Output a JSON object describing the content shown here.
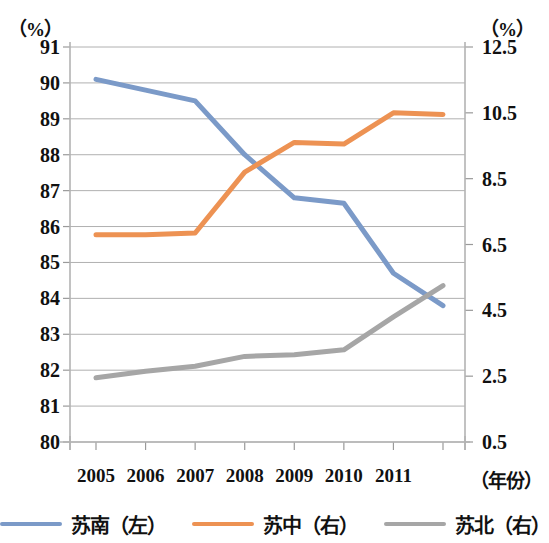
{
  "axes": {
    "left_unit": "（%）",
    "right_unit": "（%）",
    "x_caption": "（年份）",
    "left_ticks": [
      "91",
      "90",
      "89",
      "88",
      "87",
      "86",
      "85",
      "84",
      "83",
      "82",
      "81",
      "80"
    ],
    "right_ticks": [
      "12.5",
      "10.5",
      "8.5",
      "6.5",
      "4.5",
      "2.5",
      "0.5"
    ],
    "x_ticks": [
      "2005",
      "2006",
      "2007",
      "2008",
      "2009",
      "2010",
      "2011"
    ]
  },
  "legend": {
    "items": [
      {
        "label": "苏南（左）",
        "color": "#7b9ac8"
      },
      {
        "label": "苏中（右）",
        "color": "#ed9253"
      },
      {
        "label": "苏北（右）",
        "color": "#a6a6a6"
      }
    ]
  },
  "chart_data": {
    "type": "line",
    "title": "",
    "xlabel": "（年份）",
    "ylabel": "（%）",
    "grid": true,
    "legend_position": "bottom",
    "x": [
      2005,
      2006,
      2007,
      2008,
      2009,
      2010,
      2011,
      2012
    ],
    "x_tick_labels": [
      "2005",
      "2006",
      "2007",
      "2008",
      "2009",
      "2010",
      "2011",
      ""
    ],
    "y_left_label": "（%）",
    "y_right_label": "（%）",
    "ylim_left": [
      80,
      91
    ],
    "ylim_right": [
      0.5,
      12.5
    ],
    "yticks_left": [
      80,
      81,
      82,
      83,
      84,
      85,
      86,
      87,
      88,
      89,
      90,
      91
    ],
    "yticks_right": [
      0.5,
      2.5,
      4.5,
      6.5,
      8.5,
      10.5,
      12.5
    ],
    "series": [
      {
        "name": "苏南（左）",
        "axis": "left",
        "color": "#7b9ac8",
        "values": [
          90.1,
          89.8,
          89.5,
          88.0,
          86.8,
          86.65,
          84.7,
          83.8
        ]
      },
      {
        "name": "苏中（右）",
        "axis": "right",
        "color": "#ed9253",
        "values": [
          6.8,
          6.8,
          6.85,
          8.7,
          9.6,
          9.55,
          10.5,
          10.45
        ]
      },
      {
        "name": "苏北（右）",
        "axis": "right",
        "color": "#a6a6a6",
        "values": [
          2.45,
          2.65,
          2.8,
          3.1,
          3.15,
          3.3,
          4.3,
          5.25
        ]
      }
    ]
  }
}
